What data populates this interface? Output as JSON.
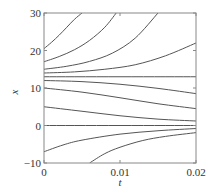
{
  "chart_data": {
    "type": "line",
    "title": "",
    "xlabel": "t",
    "ylabel": "x",
    "xlim": [
      0,
      0.02
    ],
    "ylim": [
      -10,
      30
    ],
    "xticks": [
      0,
      0.01,
      0.02
    ],
    "xtick_labels": [
      "0",
      "0.01",
      "0.02"
    ],
    "yticks": [
      -10,
      0,
      10,
      20,
      30
    ],
    "ytick_labels": [
      "−10",
      "0",
      "10",
      "20",
      "30"
    ],
    "grid": false,
    "legend": null,
    "line_color": "#555555",
    "series": [
      {
        "name": "x0=20.5",
        "x": [
          0,
          0.001,
          0.002,
          0.003,
          0.004,
          0.005
        ],
        "y": [
          20.5,
          22.2,
          24.1,
          26.2,
          28.3,
          30
        ]
      },
      {
        "name": "x0=17",
        "x": [
          0,
          0.002,
          0.004,
          0.006,
          0.008,
          0.0095
        ],
        "y": [
          17,
          18.4,
          20.2,
          22.7,
          26.2,
          30
        ]
      },
      {
        "name": "x0=15",
        "x": [
          0,
          0.003,
          0.006,
          0.009,
          0.012,
          0.015
        ],
        "y": [
          15,
          15.8,
          17.1,
          19.3,
          23.3,
          30
        ]
      },
      {
        "name": "x0=14",
        "x": [
          0,
          0.004,
          0.008,
          0.012,
          0.016,
          0.02
        ],
        "y": [
          14,
          14.3,
          15,
          16.2,
          18.6,
          22
        ]
      },
      {
        "name": "x0=13",
        "x": [
          0,
          0.02
        ],
        "y": [
          13,
          13
        ]
      },
      {
        "name": "x0=12",
        "x": [
          0,
          0.005,
          0.01,
          0.015,
          0.02
        ],
        "y": [
          12,
          11.7,
          11,
          9.9,
          8.5
        ]
      },
      {
        "name": "x0=10",
        "x": [
          0,
          0.005,
          0.01,
          0.015,
          0.02
        ],
        "y": [
          10,
          8.9,
          7.4,
          5.8,
          4.5
        ]
      },
      {
        "name": "x0=5",
        "x": [
          0,
          0.005,
          0.01,
          0.015,
          0.02
        ],
        "y": [
          5,
          3.8,
          2.6,
          1.7,
          1.2
        ]
      },
      {
        "name": "x0=0",
        "x": [
          0,
          0.02
        ],
        "y": [
          0,
          0
        ]
      },
      {
        "name": "x0=-7",
        "x": [
          0,
          0.0025,
          0.005,
          0.01,
          0.015,
          0.02
        ],
        "y": [
          -7,
          -5.2,
          -3.9,
          -2.3,
          -1.4,
          -0.8
        ]
      },
      {
        "name": "x0=-10 at t=0.006",
        "x": [
          0.006,
          0.008,
          0.01,
          0.013,
          0.016,
          0.02
        ],
        "y": [
          -10,
          -7.5,
          -5.8,
          -4,
          -2.9,
          -1.9
        ]
      }
    ]
  }
}
